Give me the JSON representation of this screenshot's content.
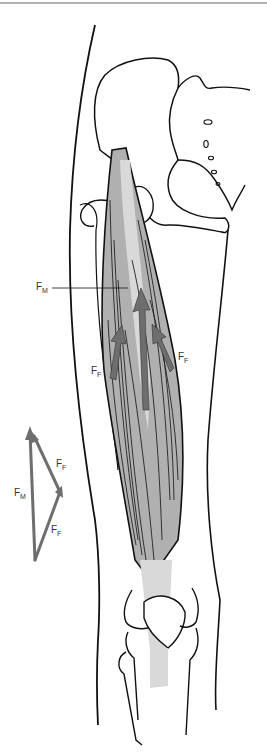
{
  "figure": {
    "colors": {
      "outline": "#111111",
      "muscle_fill": "#b0b0b0",
      "tendon_fill": "#d9d9d9",
      "arrow": "#6e6e6e",
      "top_rule": "#999999"
    }
  },
  "labels": {
    "fm_main": {
      "base": "F",
      "sub": "M"
    },
    "ff_left": {
      "base": "F",
      "sub": "F"
    },
    "ff_right": {
      "base": "F",
      "sub": "F"
    },
    "fm_triangle": {
      "base": "F",
      "sub": "M"
    },
    "ff_triangle_top": {
      "base": "F",
      "sub": "F"
    },
    "ff_triangle_bottom": {
      "base": "F",
      "sub": "F"
    }
  }
}
